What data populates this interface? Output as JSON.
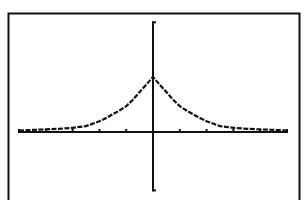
{
  "screen": {
    "type": "graphing-calculator-graph",
    "background": "#ffffff",
    "ink": "#111111"
  },
  "chart_data": {
    "type": "line",
    "title": "",
    "xlabel": "",
    "ylabel": "",
    "xlim": [
      -5,
      5
    ],
    "ylim": [
      -1.1,
      2.05
    ],
    "x_tick_step": 1,
    "grid": false,
    "legend": null,
    "series": [
      {
        "name": "y1",
        "x": [
          -5,
          -4.5,
          -4,
          -3.5,
          -3,
          -2.5,
          -2,
          -1.75,
          -1.5,
          -1.25,
          -1,
          -0.75,
          -0.5,
          -0.25,
          0,
          0.25,
          0.5,
          0.75,
          1,
          1.25,
          1.5,
          1.75,
          2,
          2.5,
          3,
          3.5,
          4,
          4.5,
          5
        ],
        "y": [
          0.01,
          0.02,
          0.03,
          0.04,
          0.06,
          0.09,
          0.18,
          0.24,
          0.31,
          0.38,
          0.46,
          0.58,
          0.72,
          0.86,
          1.0,
          0.86,
          0.72,
          0.58,
          0.46,
          0.38,
          0.31,
          0.24,
          0.18,
          0.09,
          0.06,
          0.04,
          0.03,
          0.02,
          0.01
        ]
      }
    ],
    "annotations": []
  }
}
